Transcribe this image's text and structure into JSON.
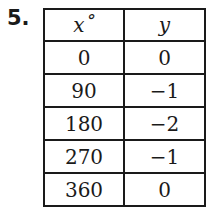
{
  "problem_number": "5.",
  "table": {
    "headers": [
      "x˚",
      "y"
    ],
    "rows": [
      [
        "0",
        "0"
      ],
      [
        "90",
        "−1"
      ],
      [
        "180",
        "−2"
      ],
      [
        "270",
        "−1"
      ],
      [
        "360",
        "0"
      ]
    ]
  }
}
